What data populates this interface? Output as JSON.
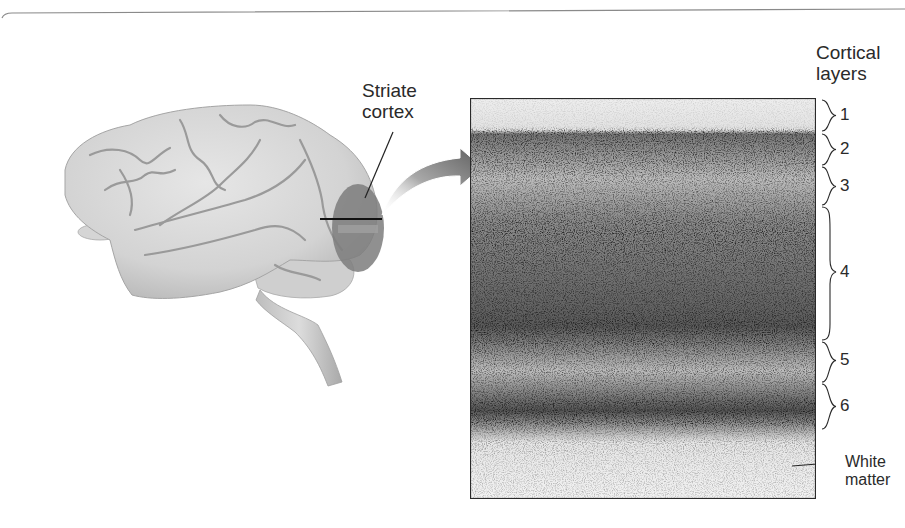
{
  "figure": {
    "brain_label": {
      "line1": "Striate",
      "line2": "cortex"
    },
    "layers_title": {
      "line1": "Cortical",
      "line2": "layers"
    },
    "layers": [
      {
        "label": "1",
        "top": 98,
        "bottom": 133
      },
      {
        "label": "2",
        "top": 133,
        "bottom": 165
      },
      {
        "label": "3",
        "top": 165,
        "bottom": 205
      },
      {
        "label": "4",
        "top": 205,
        "bottom": 340
      },
      {
        "label": "5",
        "top": 340,
        "bottom": 383
      },
      {
        "label": "6",
        "top": 383,
        "bottom": 430
      }
    ],
    "white_matter_label": {
      "line1": "White",
      "line2": "matter"
    },
    "colors": {
      "brain_fill": "#d9d9d9",
      "brain_shadow": "#b8b8b8",
      "striate_region": "#7a7a7a",
      "arrow": "#6b6b6b",
      "stain_dark": "#1c1c1c",
      "stain_light": "#e6e6e6",
      "text": "#2a2a2a"
    }
  }
}
